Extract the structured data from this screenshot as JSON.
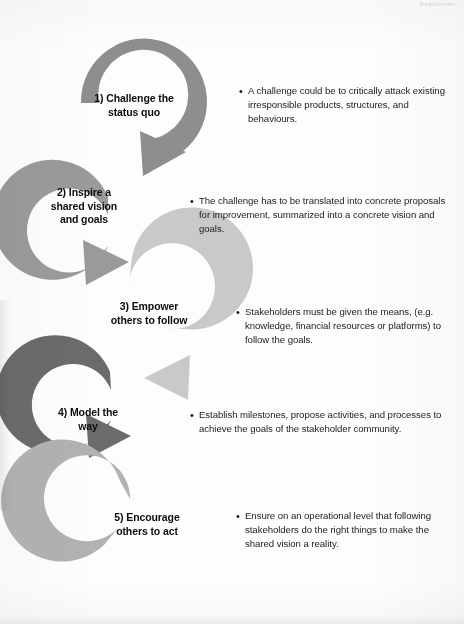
{
  "page": {
    "header_mark": "Reaktionen",
    "background_color": "#fdfdfc",
    "text_color": "#1a1a1a"
  },
  "diagram": {
    "type": "cycle-arrow-flow",
    "title": "",
    "orientation": "vertical-alternating",
    "arc_colors": [
      "#8e8e8e",
      "#9a9a9a",
      "#c9c9c9",
      "#6b6b6b",
      "#b2b2b2"
    ],
    "steps": [
      {
        "index": 1,
        "label": "1) Challenge the\nstatus quo",
        "arc_color": "#8e8e8e",
        "arc_opening": "left",
        "arrow_position": "bottom-right",
        "bullet": "A challenge could be to critically attack existing irresponsible products, structures, and behaviours."
      },
      {
        "index": 2,
        "label": "2) Inspire a\nshared vision\nand goals",
        "arc_color": "#9a9a9a",
        "arc_opening": "right",
        "arrow_position": "bottom-right",
        "bullet": "The challenge has to be translated  into concrete proposals for improvement, summarized into a concrete vision and goals."
      },
      {
        "index": 3,
        "label": "3) Empower\nothers to follow",
        "arc_color": "#c9c9c9",
        "arc_opening": "left",
        "arrow_position": "bottom-left",
        "bullet": "Stakeholders must be given the means, (e.g. knowledge, financial resources or platforms) to follow the goals."
      },
      {
        "index": 4,
        "label": "4) Model the\nway",
        "arc_color": "#6b6b6b",
        "arc_opening": "right",
        "arrow_position": "bottom-right",
        "bullet": "Establish milestones, propose activities, and processes to achieve the goals of the stakeholder community."
      },
      {
        "index": 5,
        "label": "5) Encourage\nothers to act",
        "arc_color": "#b2b2b2",
        "arc_opening": "top-left",
        "arrow_position": "none",
        "bullet": "Ensure on an operational level that following stakeholders do the right things to make the shared vision a reality."
      }
    ]
  }
}
